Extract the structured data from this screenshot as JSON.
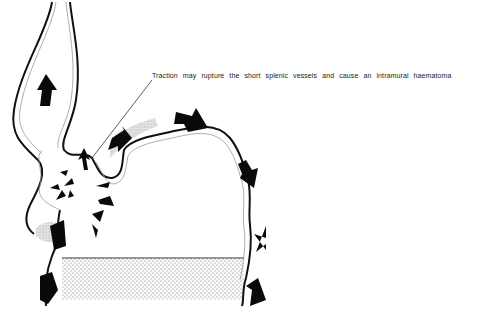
{
  "figure": {
    "annotation": "Traction may rupture the short splenic vessels and cause an intramural haematoma",
    "colors": {
      "wall": "#111111",
      "mucosa_line": "#9a9a9a",
      "arrow": "#0a0a0a",
      "haematoma_shade": "#c8c8c8",
      "stipple": "#555555"
    },
    "elements": [
      "oesophagus",
      "stomach-fundus",
      "short-splenic-vessels-haematoma",
      "pressure-arrows",
      "stippled-viscus"
    ]
  }
}
